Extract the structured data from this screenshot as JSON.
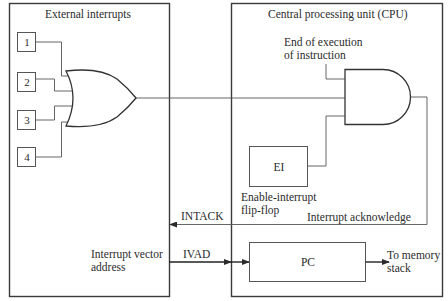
{
  "diagram": {
    "external_panel": {
      "title": "External interrupts",
      "inputs": [
        {
          "label": "1"
        },
        {
          "label": "2"
        },
        {
          "label": "3"
        },
        {
          "label": "4"
        }
      ],
      "gate": "OR",
      "vector_label_line1": "Interrupt vector",
      "vector_label_line2": "address"
    },
    "cpu_panel": {
      "title": "Central processing unit (CPU)",
      "end_exec_line1": "End of execution",
      "end_exec_line2": "of instruction",
      "gate": "AND",
      "ei_box": "EI",
      "ei_caption_line1": "Enable-interrupt",
      "ei_caption_line2": "flip-flop",
      "ack_label": "Interrupt acknowledge",
      "pc_box": "PC",
      "to_memory_line1": "To memory",
      "to_memory_line2": "stack"
    },
    "signals": {
      "intack": "INTACK",
      "ivad": "IVAD"
    },
    "colors": {
      "line": "#3a3a3a",
      "background": "#ffffff"
    }
  }
}
